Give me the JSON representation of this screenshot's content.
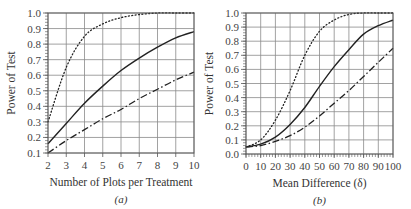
{
  "chart_data": [
    {
      "id": "a",
      "type": "line",
      "panel_label": "(a)",
      "title": "",
      "xlabel": "Number of Plots per Treatment",
      "ylabel": "Power of Test",
      "xlim": [
        2,
        10
      ],
      "ylim": [
        0.1,
        1.0
      ],
      "x_ticks": [
        2,
        3,
        4,
        5,
        6,
        7,
        8,
        9,
        10
      ],
      "y_ticks": [
        0.1,
        0.2,
        0.3,
        0.4,
        0.5,
        0.6,
        0.7,
        0.8,
        0.9,
        1.0
      ],
      "y_tick_labels": [
        "0.1",
        "0.2",
        "0.3",
        "0.4",
        "0.5",
        "0.6",
        "0.7",
        "0.8",
        "0.9",
        "1.0"
      ],
      "x_minor_step": null,
      "y_minor_step": 0.02,
      "grid": true,
      "legend": null,
      "x": [
        2,
        3,
        4,
        5,
        6,
        7,
        8,
        9,
        10
      ],
      "series": [
        {
          "name": "dotted",
          "style": "dotted",
          "values": [
            0.3,
            0.65,
            0.85,
            0.93,
            0.97,
            0.99,
            1.0,
            1.0,
            1.0
          ]
        },
        {
          "name": "solid",
          "style": "solid",
          "values": [
            0.16,
            0.29,
            0.42,
            0.53,
            0.63,
            0.71,
            0.78,
            0.84,
            0.88
          ]
        },
        {
          "name": "dash-dot",
          "style": "dashdot",
          "values": [
            0.1,
            0.18,
            0.25,
            0.32,
            0.38,
            0.45,
            0.51,
            0.57,
            0.62
          ]
        }
      ]
    },
    {
      "id": "b",
      "type": "line",
      "panel_label": "(b)",
      "title": "",
      "xlabel": "Mean Difference (δ)",
      "ylabel": "Power of Test",
      "xlim": [
        0,
        100
      ],
      "ylim": [
        0.0,
        1.0
      ],
      "x_ticks": [
        0,
        10,
        20,
        30,
        40,
        50,
        60,
        70,
        80,
        90,
        100
      ],
      "y_ticks": [
        0.0,
        0.1,
        0.2,
        0.3,
        0.4,
        0.5,
        0.6,
        0.7,
        0.8,
        0.9,
        1.0
      ],
      "y_tick_labels": [
        "0.0",
        "0.1",
        "0.2",
        "0.3",
        "0.4",
        "0.5",
        "0.6",
        "0.7",
        "0.8",
        "0.9",
        "1.0"
      ],
      "x_minor_step": 2,
      "y_minor_step": 0.02,
      "grid": true,
      "legend": null,
      "x": [
        0,
        10,
        20,
        30,
        40,
        50,
        60,
        70,
        80,
        90,
        100
      ],
      "series": [
        {
          "name": "dotted",
          "style": "dotted",
          "values": [
            0.05,
            0.1,
            0.24,
            0.45,
            0.7,
            0.87,
            0.95,
            0.99,
            1.0,
            1.0,
            1.0
          ]
        },
        {
          "name": "solid",
          "style": "solid",
          "values": [
            0.05,
            0.07,
            0.12,
            0.21,
            0.33,
            0.48,
            0.62,
            0.74,
            0.85,
            0.91,
            0.95
          ]
        },
        {
          "name": "dash-dot",
          "style": "dashdot",
          "values": [
            0.05,
            0.06,
            0.09,
            0.13,
            0.19,
            0.27,
            0.36,
            0.45,
            0.55,
            0.65,
            0.75
          ]
        }
      ]
    }
  ],
  "layout": {
    "panels": [
      {
        "left": 48,
        "top": 13,
        "right": 194,
        "bottom": 153
      },
      {
        "left": 246,
        "top": 13,
        "right": 393,
        "bottom": 154
      }
    ]
  },
  "colors": {
    "grid": "#8a8a8a",
    "axis": "#555555",
    "curve": "#222222"
  }
}
